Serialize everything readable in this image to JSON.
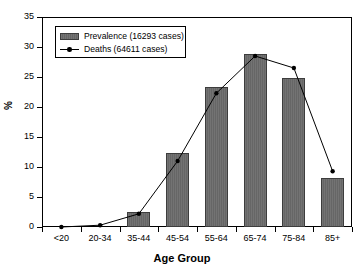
{
  "chart_data": {
    "type": "bar",
    "title": "",
    "subtitle": "",
    "xlabel": "Age Group",
    "ylabel": "%",
    "categories": [
      "<20",
      "20-34",
      "35-44",
      "45-54",
      "55-64",
      "65-74",
      "75-84",
      "85+"
    ],
    "series": [
      {
        "name": "Prevalence (16293 cases)",
        "type": "bar",
        "values": [
          0.0,
          0.1,
          2.5,
          12.3,
          23.3,
          28.8,
          24.8,
          8.2
        ]
      },
      {
        "name": "Deaths (64611 cases)",
        "type": "line",
        "values": [
          0.0,
          0.3,
          2.2,
          11.0,
          22.3,
          28.5,
          26.5,
          9.3
        ]
      }
    ],
    "ylim": [
      0,
      35
    ],
    "yticks": [
      0,
      5,
      10,
      15,
      20,
      25,
      30,
      35
    ],
    "ytick_labels": [
      "0",
      "5",
      "10",
      "15",
      "20",
      "25",
      "30",
      "35"
    ],
    "grid": false,
    "legend_position": "upper left",
    "colors": {
      "bar_fill": "#6b6b6b",
      "bar_edge": "#3d3d3d",
      "line": "#000000",
      "marker": "#000000",
      "axis": "#000000",
      "background": "#ffffff"
    }
  },
  "legend": {
    "entries": [
      {
        "label": "Prevalence (16293 cases)",
        "marker": "filled-square-swatch"
      },
      {
        "label": "Deaths (64611 cases)",
        "marker": "line-with-dot"
      }
    ]
  }
}
